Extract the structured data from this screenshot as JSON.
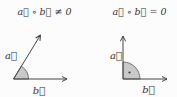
{
  "figure": {
    "panels": [
      {
        "id": "nonzero-dot-product",
        "title": "a⃗ ∘ b⃗ ≠ 0",
        "a_label": "a⃗",
        "b_label": "b⃗",
        "angle_marker": "shaded-acute-sector"
      },
      {
        "id": "zero-dot-product",
        "title": "a⃗ ∘ b⃗ = 0",
        "a_label": "a⃗",
        "b_label": "b⃗",
        "angle_marker": "shaded-right-angle-sector-with-dot"
      }
    ],
    "colors": {
      "background": "#fcfcfc",
      "line": "#444444",
      "sector_fill": "#c9c9c9",
      "sector_stroke": "#5a5a5a",
      "text": "#333333"
    }
  }
}
